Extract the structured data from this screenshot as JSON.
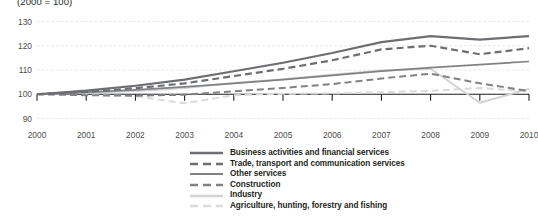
{
  "subtitle": "(2000 = 100)",
  "chart_data": {
    "type": "line",
    "title": "",
    "subtitle": "(2000 = 100)",
    "xlabel": "",
    "ylabel": "",
    "x": [
      2000,
      2001,
      2002,
      2003,
      2004,
      2005,
      2006,
      2007,
      2008,
      2009,
      2010
    ],
    "categories": [
      "2000",
      "2001",
      "2002",
      "2003",
      "2004",
      "2005",
      "2006",
      "2007",
      "2008",
      "2009",
      "2010"
    ],
    "xlim": [
      2000,
      2010
    ],
    "ylim": [
      90,
      130
    ],
    "yticks": [
      90,
      100,
      110,
      120,
      130
    ],
    "grid": true,
    "grid_axis": "y",
    "legend_position": "bottom",
    "series": [
      {
        "name": "Business activities and financial services",
        "style": "solid",
        "color": "#6d6e71",
        "width": 2.2,
        "values": [
          100,
          101.5,
          103.5,
          106,
          109.5,
          113,
          117,
          121.5,
          124,
          122.5,
          124
        ]
      },
      {
        "name": "Trade, transport and communication services",
        "style": "dashed",
        "color": "#6d6e71",
        "width": 2.2,
        "values": [
          100,
          101,
          102.5,
          104.5,
          107.5,
          110.5,
          114,
          118.5,
          120,
          116.5,
          119
        ]
      },
      {
        "name": "Other services",
        "style": "solid",
        "color": "#808285",
        "width": 1.7,
        "values": [
          100,
          100.8,
          101.8,
          103,
          104.5,
          106,
          107.8,
          109.5,
          111,
          112.2,
          113.5
        ]
      },
      {
        "name": "Construction",
        "style": "dashed",
        "color": "#808285",
        "width": 2.0,
        "values": [
          100,
          99.6,
          99.4,
          99.8,
          101.2,
          102.6,
          104.2,
          106.5,
          108.5,
          104.5,
          101.3
        ]
      },
      {
        "name": "Industry",
        "style": "solid",
        "color": "#d1d3d4",
        "width": 2.0,
        "values": [
          100,
          100.6,
          101.3,
          102.6,
          104.6,
          106.2,
          108,
          109.8,
          110.5,
          96.5,
          102.2
        ]
      },
      {
        "name": "Agriculture, hunting, forestry and fishing",
        "style": "dashed",
        "color": "#d9dadb",
        "width": 2.0,
        "values": [
          100,
          99.8,
          99.2,
          96.3,
          99.6,
          100.2,
          100.4,
          100.8,
          101.4,
          102.6,
          101.2
        ]
      }
    ]
  },
  "legend": {
    "items": [
      {
        "label": "Business activities and financial services"
      },
      {
        "label": "Trade, transport and communication services"
      },
      {
        "label": "Other services"
      },
      {
        "label": "Construction"
      },
      {
        "label": "Industry"
      },
      {
        "label": "Agriculture, hunting, forestry and fishing"
      }
    ]
  }
}
